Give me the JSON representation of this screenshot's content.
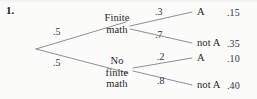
{
  "problem": {
    "number": "1."
  },
  "tree": {
    "root_branches": [
      {
        "probability": ".5",
        "label_lines": [
          "Finite",
          "math"
        ]
      },
      {
        "probability": ".5",
        "label_lines": [
          "No",
          "finite",
          "math"
        ]
      }
    ],
    "second_level": [
      {
        "probability": ".3",
        "outcome": "A",
        "value": ".15"
      },
      {
        "probability": ".7",
        "outcome": "not A",
        "value": ".35"
      },
      {
        "probability": ".2",
        "outcome": "A",
        "value": ".10"
      },
      {
        "probability": ".8",
        "outcome": "not A",
        "value": ".40"
      }
    ]
  },
  "style": {
    "line_color": "#8d8f99",
    "text_color": "#1f1f24",
    "background": "#fbfbfa"
  }
}
